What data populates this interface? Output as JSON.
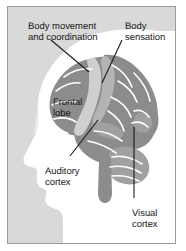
{
  "panel": {
    "background_color": "#d9d9d9",
    "border_color": "#9a9a9a",
    "page_background": "#ffffff"
  },
  "palette": {
    "head_silhouette": "#ffffff",
    "brain_dark_gray": "#8c8c8c",
    "brain_mid_gray": "#a8a8a8",
    "brain_light_gray": "#cfcfcf",
    "outline": "#ffffff",
    "leader_line": "#1a1a1a",
    "text": "#1a1a1a"
  },
  "labels": [
    {
      "id": "motor",
      "text": "Body movement\nand coordination",
      "region": "primary motor cortex",
      "x": 20,
      "y": 15,
      "leader": {
        "from_x": 50,
        "from_y": 40,
        "to_x": 88,
        "to_y": 72
      }
    },
    {
      "id": "sensation",
      "text": "Body\nsensation",
      "region": "primary somatosensory cortex",
      "x": 117,
      "y": 15,
      "leader": {
        "from_x": 121,
        "from_y": 40,
        "to_x": 101,
        "to_y": 83
      }
    },
    {
      "id": "frontal",
      "text": "Frontal\nlobe",
      "region": "frontal lobe",
      "x": 45,
      "y": 91,
      "leader": null
    },
    {
      "id": "auditory",
      "text": "Auditory\ncortex",
      "region": "auditory cortex",
      "x": 37,
      "y": 160,
      "leader": {
        "from_x": 69,
        "from_y": 156,
        "to_x": 97,
        "to_y": 120
      }
    },
    {
      "id": "visual",
      "text": "Visual\ncortex",
      "region": "visual cortex",
      "x": 124,
      "y": 202,
      "leader": {
        "from_x": 133,
        "from_y": 198,
        "to_x": 133,
        "to_y": 127
      }
    }
  ]
}
